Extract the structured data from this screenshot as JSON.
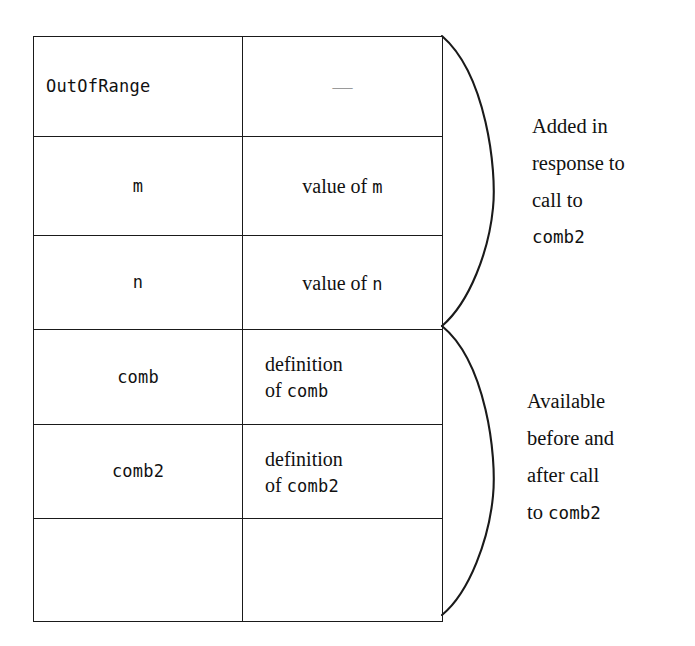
{
  "diagram": {
    "line_color": "#1a1a1a",
    "text_color": "#111111",
    "dash_color": "#9a9a9a"
  },
  "table": {
    "columns": [
      "name",
      "value"
    ],
    "rows": [
      {
        "id": "outofrange",
        "name": "OutOfRange",
        "name_style": "mono",
        "name_align": "left",
        "value": "—",
        "value_style": "dash",
        "value_lines": []
      },
      {
        "id": "m",
        "name": "m",
        "name_style": "mono",
        "name_align": "center",
        "value": "value of m",
        "value_style": "serif",
        "value_lines": [
          "value of ",
          "m"
        ]
      },
      {
        "id": "n",
        "name": "n",
        "name_style": "mono",
        "name_align": "center",
        "value": "value of n",
        "value_style": "serif",
        "value_lines": [
          "value of ",
          "n"
        ]
      },
      {
        "id": "comb",
        "name": "comb",
        "name_style": "mono",
        "name_align": "center",
        "value": "definition of comb",
        "value_style": "serif-two-line",
        "value_lines": [
          "definition",
          "of ",
          "comb"
        ]
      },
      {
        "id": "comb2",
        "name": "comb2",
        "name_style": "mono",
        "name_align": "center",
        "value": "definition of comb2",
        "value_style": "serif-two-line",
        "value_lines": [
          "definition",
          "of ",
          "comb2"
        ]
      },
      {
        "id": "blank",
        "name": "",
        "name_style": "mono",
        "name_align": "center",
        "value": "",
        "value_style": "serif",
        "value_lines": []
      }
    ]
  },
  "cells": {
    "outofrange_name": "OutOfRange",
    "outofrange_value": "—",
    "m_name": "m",
    "m_value_pre": "value of ",
    "m_value_code": "m",
    "n_name": "n",
    "n_value_pre": "value of ",
    "n_value_code": "n",
    "comb_name": "comb",
    "comb_value_l1": "definition",
    "comb_value_l2_pre": "of ",
    "comb_value_l2_code": "comb",
    "comb2_name": "comb2",
    "comb2_value_l1": "definition",
    "comb2_value_l2_pre": "of ",
    "comb2_value_l2_code": "comb2",
    "blank_name": "",
    "blank_value": ""
  },
  "annotations": [
    {
      "id": "added",
      "lines": [
        "Added in",
        "response to",
        "call to",
        "comb2"
      ],
      "code_line_index": 3,
      "brace": "upper"
    },
    {
      "id": "available",
      "lines": [
        "Available",
        "before and",
        "after call",
        "to comb2"
      ],
      "code_line_index": 3,
      "brace": "lower"
    }
  ],
  "annotation_added": {
    "line1": "Added in",
    "line2": "response to",
    "line3": "call to",
    "line4": "comb2"
  },
  "annotation_available": {
    "line1": "Available",
    "line2": "before and",
    "line3": "after call",
    "line4_pre": "to ",
    "line4_code": "comb2"
  },
  "braces": {
    "upper": {
      "label": "upper-lens-brace",
      "top_y": 36,
      "bottom_y": 326,
      "anchor_x": 442,
      "bulge_x": 492
    },
    "lower": {
      "label": "lower-lens-brace",
      "top_y": 326,
      "bottom_y": 615,
      "anchor_x": 442,
      "bulge_x": 492
    }
  }
}
